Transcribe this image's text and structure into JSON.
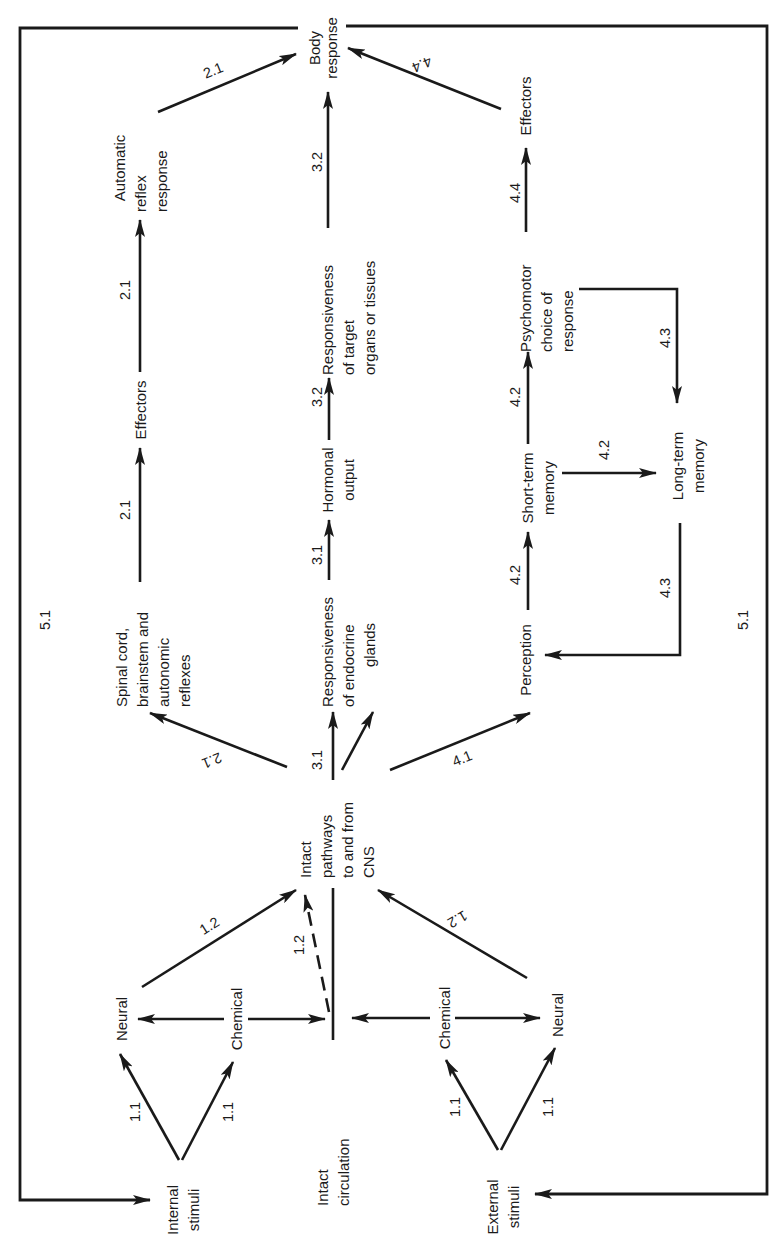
{
  "diagram": {
    "orientation": "rotated 90° counterclockwise (text reads bottom-to-top)",
    "nodes": {
      "body_response": [
        "Body",
        "response"
      ],
      "automatic_reflex_response": [
        "Automatic",
        "reflex",
        "response"
      ],
      "effectors_reflex": [
        "Effectors"
      ],
      "spinal_cord": [
        "Spinal cord,",
        "brainstem and",
        "autonomic",
        "reflexes"
      ],
      "responsiveness_target": [
        "Responsiveness",
        "of target",
        "organs or tissues"
      ],
      "hormonal_output": [
        "Hormonal",
        "output"
      ],
      "responsiveness_endocrine": [
        "Responsiveness",
        "of endocrine",
        "glands"
      ],
      "effectors_psychomotor": [
        "Effectors"
      ],
      "psychomotor_choice": [
        "Psychomotor",
        "choice of",
        "response"
      ],
      "short_term_memory": [
        "Short-term",
        "memory"
      ],
      "long_term_memory": [
        "Long-term",
        "memory"
      ],
      "perception": [
        "Perception"
      ],
      "intact_pathways": [
        "Intact",
        "pathways",
        "to and from",
        "CNS"
      ],
      "neural_internal": [
        "Neural"
      ],
      "chemical_internal": [
        "Chemical"
      ],
      "intact_circulation": [
        "Intact",
        "circulation"
      ],
      "chemical_external": [
        "Chemical"
      ],
      "neural_external": [
        "Neural"
      ],
      "internal_stimuli": [
        "Internal",
        "stimuli"
      ],
      "external_stimuli": [
        "External",
        "stimuli"
      ]
    },
    "edges": [
      {
        "from": "internal_stimuli",
        "to": "neural_internal",
        "label": "1.1"
      },
      {
        "from": "internal_stimuli",
        "to": "chemical_internal",
        "label": "1.1"
      },
      {
        "from": "external_stimuli",
        "to": "chemical_external",
        "label": "1.1"
      },
      {
        "from": "external_stimuli",
        "to": "neural_external",
        "label": "1.1"
      },
      {
        "from": "chemical_internal",
        "to": "neural_internal",
        "label": ""
      },
      {
        "from": "chemical_internal",
        "to": "intact_circulation",
        "label": ""
      },
      {
        "from": "chemical_external",
        "to": "intact_circulation",
        "label": ""
      },
      {
        "from": "chemical_external",
        "to": "neural_external",
        "label": ""
      },
      {
        "from": "neural_internal",
        "to": "intact_pathways",
        "label": "1.2"
      },
      {
        "from": "intact_circulation",
        "to": "intact_pathways",
        "label": "1.2",
        "style": "dashed"
      },
      {
        "from": "neural_external",
        "to": "intact_pathways",
        "label": "1.2"
      },
      {
        "from": "intact_pathways",
        "to": "spinal_cord",
        "label": "2.1"
      },
      {
        "from": "spinal_cord",
        "to": "effectors_reflex",
        "label": "2.1"
      },
      {
        "from": "effectors_reflex",
        "to": "automatic_reflex_response",
        "label": "2.1"
      },
      {
        "from": "automatic_reflex_response",
        "to": "body_response",
        "label": "2.1"
      },
      {
        "from": "intact_pathways",
        "to": "responsiveness_endocrine",
        "label": "3.1"
      },
      {
        "from": "responsiveness_endocrine",
        "to": "hormonal_output",
        "label": "3.1"
      },
      {
        "from": "hormonal_output",
        "to": "responsiveness_target",
        "label": "3.2"
      },
      {
        "from": "responsiveness_target",
        "to": "body_response",
        "label": "3.2"
      },
      {
        "from": "intact_pathways",
        "to": "perception",
        "label": "4.1"
      },
      {
        "from": "perception",
        "to": "short_term_memory",
        "label": "4.2"
      },
      {
        "from": "short_term_memory",
        "to": "psychomotor_choice",
        "label": "4.2"
      },
      {
        "from": "short_term_memory",
        "to": "long_term_memory",
        "label": "4.2"
      },
      {
        "from": "psychomotor_choice",
        "to": "long_term_memory",
        "label": "4.3"
      },
      {
        "from": "long_term_memory",
        "to": "perception",
        "label": "4.3"
      },
      {
        "from": "psychomotor_choice",
        "to": "effectors_psychomotor",
        "label": "4.4"
      },
      {
        "from": "effectors_psychomotor",
        "to": "body_response",
        "label": "4.4"
      },
      {
        "from": "body_response",
        "to": "internal_stimuli",
        "label": "5.1",
        "style": "feedback-loop"
      },
      {
        "from": "body_response",
        "to": "external_stimuli",
        "label": "5.1",
        "style": "feedback-loop"
      }
    ],
    "labels": {
      "l_1_1": "1.1",
      "l_1_2": "1.2",
      "l_2_1": "2.1",
      "l_3_1": "3.1",
      "l_3_2": "3.2",
      "l_4_1": "4.1",
      "l_4_2": "4.2",
      "l_4_3": "4.3",
      "l_4_4": "4.4",
      "l_5_1": "5.1"
    }
  }
}
